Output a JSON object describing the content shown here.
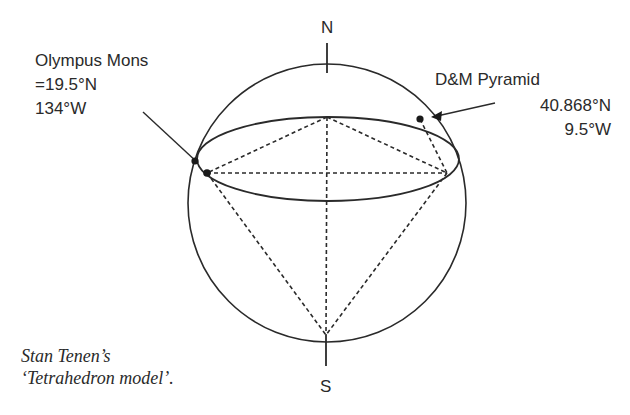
{
  "diagram": {
    "poles": {
      "north": "N",
      "south": "S"
    },
    "points": [
      {
        "name": "Olympus Mons",
        "label_line1": "Olympus Mons",
        "label_line2": "=19.5°N",
        "label_line3": "134°W"
      },
      {
        "name": "D&M Pyramid",
        "label_line1": "D&M Pyramid",
        "label_line2": "40.868°N",
        "label_line3": "9.5°W"
      }
    ],
    "caption": {
      "line1": "Stan Tenen’s",
      "line2": "‘Tetrahedron model’."
    },
    "colors": {
      "stroke": "#2a2a2a",
      "background": "#ffffff"
    }
  }
}
